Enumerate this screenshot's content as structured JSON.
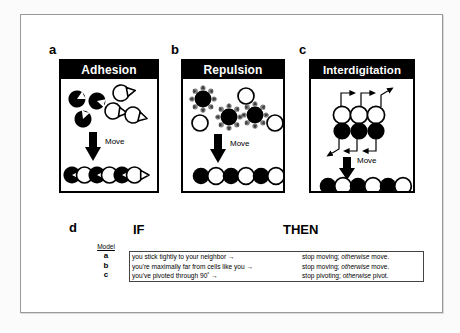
{
  "figure": {
    "panels": [
      {
        "letter": "a",
        "title": "Adhesion",
        "move_label": "Move",
        "cell_kind": "notched-adhesive-cells"
      },
      {
        "letter": "b",
        "title": "Repulsion",
        "move_label": "Move",
        "cell_kind": "haloed-repulsive-cells"
      },
      {
        "letter": "c",
        "title": "Interdigitation",
        "move_label": "Move",
        "cell_kind": "pivoting-grid-cells"
      }
    ],
    "panel_d": {
      "letter": "d",
      "model_column_header": "Model",
      "if_header": "IF",
      "then_header": "THEN",
      "rows": [
        {
          "model": "a",
          "if_text": "you stick tightly to your neighbor →",
          "then_prefix": "stop moving; ",
          "then_italic": "otherwise",
          "then_suffix": " move."
        },
        {
          "model": "b",
          "if_text": "you're maximally far from cells like you →",
          "then_prefix": "stop moving; ",
          "then_italic": "otherwise",
          "then_suffix": " move."
        },
        {
          "model": "c",
          "if_text": "you've pivoted through 90˚ →",
          "then_prefix": "stop pivoting; ",
          "then_italic": "otherwise",
          "then_suffix": " pivot."
        }
      ]
    },
    "colors": {
      "title_bar_bg": "#000000",
      "title_bar_fg": "#ffffff",
      "cell_dark": "#000000",
      "cell_light": "#ffffff",
      "halo_gray": "#8d8d8d",
      "frame_border": "#9a9a9a"
    }
  }
}
